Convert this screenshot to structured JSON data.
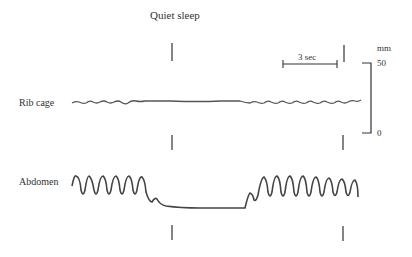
{
  "title": "Quiet sleep",
  "channels": [
    {
      "label": "Rib cage"
    },
    {
      "label": "Abdomen"
    }
  ],
  "time_scale": {
    "label": "3 sec"
  },
  "amplitude_scale": {
    "unit": "mm",
    "max": "50",
    "min": "0"
  },
  "colors": {
    "trace": "#444444",
    "text": "#333333"
  }
}
